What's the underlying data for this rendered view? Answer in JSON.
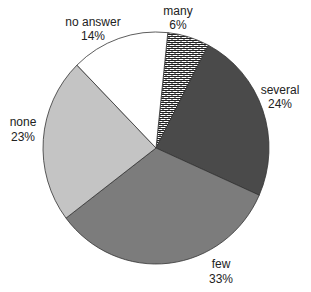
{
  "chart_data": {
    "type": "pie",
    "title": "",
    "slices": [
      {
        "label": "many",
        "value": 6,
        "pct_label": "6%",
        "fill": "pattern",
        "color": "#ffffff"
      },
      {
        "label": "several",
        "value": 24,
        "pct_label": "24%",
        "fill": "solid",
        "color": "#4a4a4a"
      },
      {
        "label": "few",
        "value": 33,
        "pct_label": "33%",
        "fill": "solid",
        "color": "#7c7c7c"
      },
      {
        "label": "none",
        "value": 23,
        "pct_label": "23%",
        "fill": "solid",
        "color": "#c4c4c4"
      },
      {
        "label": "no answer",
        "value": 14,
        "pct_label": "14%",
        "fill": "solid",
        "color": "#ffffff"
      }
    ],
    "start_angle_deg_from_top": 6,
    "direction": "clockwise",
    "legend": "none",
    "labels_position": "outside"
  },
  "labels": {
    "many": {
      "name": "many",
      "pct": "6%"
    },
    "several": {
      "name": "several",
      "pct": "24%"
    },
    "few": {
      "name": "few",
      "pct": "33%"
    },
    "none": {
      "name": "none",
      "pct": "23%"
    },
    "no_answer": {
      "name": "no answer",
      "pct": "14%"
    }
  }
}
